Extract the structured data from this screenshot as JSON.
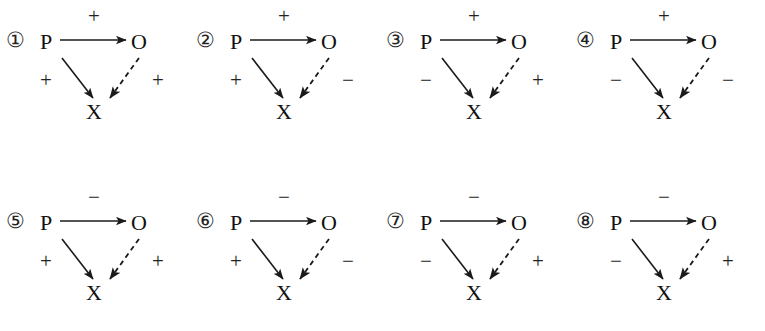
{
  "figure": {
    "background_color": "#ffffff",
    "ink_color": "#1a1a1a",
    "rows": 2,
    "columns": 4,
    "node_labels": {
      "exposure": "P",
      "outcome": "O",
      "collider": "X"
    },
    "edge_styles": {
      "p_to_o": "solid",
      "p_to_x": "solid",
      "o_to_x": "dashed"
    }
  },
  "panels": [
    {
      "index": "①",
      "number": 1,
      "nodes": {
        "p": "P",
        "o": "O",
        "x": "X"
      },
      "signs": {
        "p_to_o": "+",
        "p_to_x": "+",
        "o_to_x": "+"
      }
    },
    {
      "index": "②",
      "number": 2,
      "nodes": {
        "p": "P",
        "o": "O",
        "x": "X"
      },
      "signs": {
        "p_to_o": "+",
        "p_to_x": "+",
        "o_to_x": "−"
      }
    },
    {
      "index": "③",
      "number": 3,
      "nodes": {
        "p": "P",
        "o": "O",
        "x": "X"
      },
      "signs": {
        "p_to_o": "+",
        "p_to_x": "−",
        "o_to_x": "+"
      }
    },
    {
      "index": "④",
      "number": 4,
      "nodes": {
        "p": "P",
        "o": "O",
        "x": "X"
      },
      "signs": {
        "p_to_o": "+",
        "p_to_x": "−",
        "o_to_x": "−"
      }
    },
    {
      "index": "⑤",
      "number": 5,
      "nodes": {
        "p": "P",
        "o": "O",
        "x": "X"
      },
      "signs": {
        "p_to_o": "−",
        "p_to_x": "+",
        "o_to_x": "+"
      }
    },
    {
      "index": "⑥",
      "number": 6,
      "nodes": {
        "p": "P",
        "o": "O",
        "x": "X"
      },
      "signs": {
        "p_to_o": "−",
        "p_to_x": "+",
        "o_to_x": "−"
      }
    },
    {
      "index": "⑦",
      "number": 7,
      "nodes": {
        "p": "P",
        "o": "O",
        "x": "X"
      },
      "signs": {
        "p_to_o": "−",
        "p_to_x": "−",
        "o_to_x": "+"
      }
    },
    {
      "index": "⑧",
      "number": 8,
      "nodes": {
        "p": "P",
        "o": "O",
        "x": "X"
      },
      "signs": {
        "p_to_o": "−",
        "p_to_x": "−",
        "o_to_x": "+"
      }
    }
  ]
}
